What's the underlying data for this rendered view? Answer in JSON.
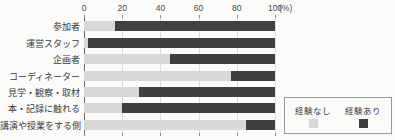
{
  "chart_data": {
    "type": "bar",
    "orientation": "horizontal-stacked",
    "title": "",
    "categories": [
      "参加者",
      "運営スタッフ",
      "企画者",
      "コーディネーター",
      "見学・観察・取材",
      "本・記録に触れる",
      "講演や授業をする側"
    ],
    "series": [
      {
        "name": "経験なし",
        "color": "#d8d8d6",
        "values": [
          16,
          2,
          45,
          77,
          29,
          20,
          85
        ]
      },
      {
        "name": "経験あり",
        "color": "#404040",
        "values": [
          84,
          98,
          55,
          23,
          71,
          80,
          15
        ]
      }
    ],
    "x_ticks": [
      0,
      20,
      40,
      60,
      80,
      100
    ],
    "xlim": [
      0,
      100
    ],
    "x_unit_label": "(%)",
    "grid": true,
    "legend_position": "bottom-right"
  },
  "colors": {
    "background": "#fbfbfa",
    "axis": "#666666",
    "gridline": "#dcdcda",
    "text": "#3a3a3a",
    "legend_border": "#999999"
  }
}
